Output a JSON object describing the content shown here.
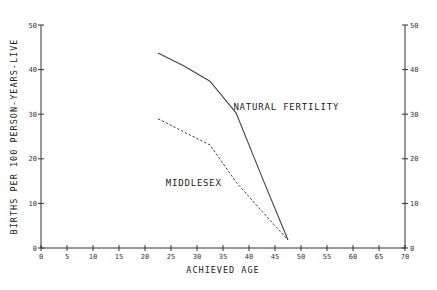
{
  "chart_data": {
    "type": "line",
    "title": "",
    "xlabel": "ACHIEVED AGE",
    "ylabel": "BIRTHS PER 100 PERSON-YEARS-LIVE",
    "xlim": [
      0,
      70
    ],
    "ylim": [
      0,
      50
    ],
    "x_ticks": [
      0,
      5,
      10,
      15,
      20,
      25,
      30,
      35,
      40,
      45,
      50,
      55,
      60,
      65,
      70
    ],
    "y_ticks": [
      0,
      10,
      20,
      30,
      40,
      50
    ],
    "right_axis_ticks": [
      0,
      10,
      20,
      30,
      40,
      50
    ],
    "grid": false,
    "series": [
      {
        "name": "NATURAL FERTILITY",
        "style": "solid",
        "x": [
          22.5,
          27.5,
          32.5,
          37.5,
          42.5,
          47.5
        ],
        "values": [
          43.7,
          40.8,
          37.4,
          30.3,
          15.9,
          1.8
        ]
      },
      {
        "name": "MIDDLESEX",
        "style": "dashed",
        "x": [
          22.5,
          27.5,
          32.5,
          37.5,
          42.5,
          47.5
        ],
        "values": [
          29.0,
          26.0,
          23.1,
          14.8,
          8.2,
          1.8
        ]
      }
    ],
    "annotations": [
      {
        "text": "NATURAL FERTILITY",
        "x": 37,
        "y": 31
      },
      {
        "text": "MIDDLESEX",
        "x": 24,
        "y": 14
      }
    ]
  }
}
